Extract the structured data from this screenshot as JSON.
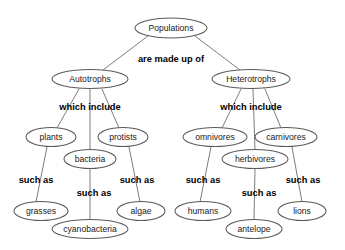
{
  "diagram": {
    "background_color": "#ffffff",
    "node_stroke_color": "#5a5a5a",
    "edge_stroke_color": "#6e6e6e",
    "node_text_color": "#1a1a1a",
    "link_text_color": "#000000"
  },
  "nodes": [
    {
      "id": "populations",
      "label": "Populations",
      "cx": 171,
      "cy": 28,
      "rx": 36,
      "ry": 10
    },
    {
      "id": "autotrophs",
      "label": "Autotrophs",
      "cx": 90,
      "cy": 79,
      "rx": 38,
      "ry": 9.5
    },
    {
      "id": "heterotrophs",
      "label": "Heterotrophs",
      "cx": 251,
      "cy": 79,
      "rx": 39,
      "ry": 9.5
    },
    {
      "id": "plants",
      "label": "plants",
      "cx": 51,
      "cy": 137,
      "rx": 25,
      "ry": 9.5
    },
    {
      "id": "protists",
      "label": "protists",
      "cx": 123,
      "cy": 137,
      "rx": 25,
      "ry": 9.5
    },
    {
      "id": "bacteria",
      "label": "bacteria",
      "cx": 90,
      "cy": 159,
      "rx": 26,
      "ry": 9.5
    },
    {
      "id": "grasses",
      "label": "grasses",
      "cx": 41,
      "cy": 211,
      "rx": 27,
      "ry": 9.5
    },
    {
      "id": "cyanobacteria",
      "label": "cyanobacteria",
      "cx": 90,
      "cy": 229,
      "rx": 38,
      "ry": 9.5
    },
    {
      "id": "algae",
      "label": "algae",
      "cx": 141,
      "cy": 211,
      "rx": 24,
      "ry": 9.5
    },
    {
      "id": "omnivores",
      "label": "omnivores",
      "cx": 215,
      "cy": 137,
      "rx": 32,
      "ry": 9.5
    },
    {
      "id": "carnivores",
      "label": "carnivores",
      "cx": 286,
      "cy": 137,
      "rx": 31,
      "ry": 9.5
    },
    {
      "id": "herbivores",
      "label": "herbivores",
      "cx": 255,
      "cy": 159,
      "rx": 33,
      "ry": 9.5
    },
    {
      "id": "humans",
      "label": "humans",
      "cx": 203,
      "cy": 211,
      "rx": 28,
      "ry": 9.5
    },
    {
      "id": "antelope",
      "label": "antelope",
      "cx": 254,
      "cy": 229,
      "rx": 28,
      "ry": 9.5
    },
    {
      "id": "lions",
      "label": "lions",
      "cx": 302,
      "cy": 211,
      "rx": 24,
      "ry": 9.5
    }
  ],
  "link_labels": [
    {
      "id": "are-made-up-of",
      "text": "are made up of",
      "x": 171,
      "y": 60
    },
    {
      "id": "which-include-left",
      "text": "which include",
      "x": 90,
      "y": 108
    },
    {
      "id": "which-include-right",
      "text": "which include",
      "x": 251,
      "y": 108
    },
    {
      "id": "such-as-plants",
      "text": "such as",
      "x": 36,
      "y": 181
    },
    {
      "id": "such-as-bacteria",
      "text": "such as",
      "x": 94,
      "y": 194
    },
    {
      "id": "such-as-protists",
      "text": "such as",
      "x": 137,
      "y": 181
    },
    {
      "id": "such-as-omnivores",
      "text": "such as",
      "x": 203,
      "y": 181
    },
    {
      "id": "such-as-herbivores",
      "text": "such as",
      "x": 259,
      "y": 194
    },
    {
      "id": "such-as-carnivores",
      "text": "such as",
      "x": 303,
      "y": 181
    }
  ],
  "edges": [
    {
      "id": "edge-populations-autotrophs",
      "from": "populations",
      "to": "autotrophs",
      "x1": 148,
      "y1": 36,
      "x2": 103,
      "y2": 70
    },
    {
      "id": "edge-populations-heterotrophs",
      "from": "populations",
      "to": "heterotrophs",
      "x1": 195,
      "y1": 36,
      "x2": 240,
      "y2": 70
    },
    {
      "id": "edge-autotrophs-plants",
      "from": "autotrophs",
      "to": "plants",
      "x1": 79,
      "y1": 89,
      "x2": 57,
      "y2": 128
    },
    {
      "id": "edge-autotrophs-bacteria",
      "from": "autotrophs",
      "to": "bacteria",
      "x1": 90,
      "y1": 89,
      "x2": 90,
      "y2": 150
    },
    {
      "id": "edge-autotrophs-protists",
      "from": "autotrophs",
      "to": "protists",
      "x1": 102,
      "y1": 89,
      "x2": 119,
      "y2": 128
    },
    {
      "id": "edge-plants-grasses",
      "from": "plants",
      "to": "grasses",
      "x1": 47,
      "y1": 147,
      "x2": 36,
      "y2": 202
    },
    {
      "id": "edge-bacteria-cyanobacteria",
      "from": "bacteria",
      "to": "cyanobacteria",
      "x1": 90,
      "y1": 169,
      "x2": 90,
      "y2": 220
    },
    {
      "id": "edge-protists-algae",
      "from": "protists",
      "to": "algae",
      "x1": 129,
      "y1": 147,
      "x2": 140,
      "y2": 202
    },
    {
      "id": "edge-heterotrophs-omnivores",
      "from": "heterotrophs",
      "to": "omnivores",
      "x1": 241,
      "y1": 89,
      "x2": 222,
      "y2": 128
    },
    {
      "id": "edge-heterotrophs-herbivores",
      "from": "heterotrophs",
      "to": "herbivores",
      "x1": 253,
      "y1": 89,
      "x2": 255,
      "y2": 150
    },
    {
      "id": "edge-heterotrophs-carnivores",
      "from": "heterotrophs",
      "to": "carnivores",
      "x1": 265,
      "y1": 89,
      "x2": 281,
      "y2": 128
    },
    {
      "id": "edge-omnivores-humans",
      "from": "omnivores",
      "to": "humans",
      "x1": 211,
      "y1": 147,
      "x2": 200,
      "y2": 202
    },
    {
      "id": "edge-herbivores-antelope",
      "from": "herbivores",
      "to": "antelope",
      "x1": 255,
      "y1": 169,
      "x2": 254,
      "y2": 220
    },
    {
      "id": "edge-carnivores-lions",
      "from": "carnivores",
      "to": "lions",
      "x1": 292,
      "y1": 147,
      "x2": 302,
      "y2": 202
    }
  ]
}
